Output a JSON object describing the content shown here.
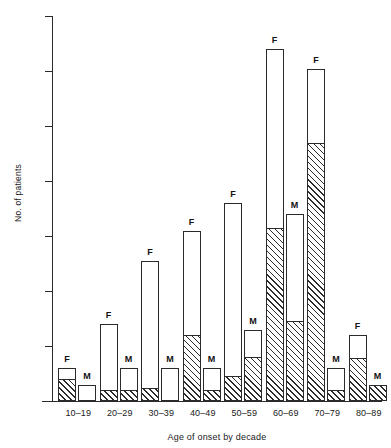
{
  "chart_data": {
    "type": "bar",
    "title": "",
    "xlabel": "Age of onset by decade",
    "ylabel": "No. of patients",
    "ylim": [
      0,
      35
    ],
    "yticks": [
      0,
      5,
      10,
      15,
      20,
      25,
      30,
      35
    ],
    "ytick_labels": [
      "",
      "5",
      "10",
      "15",
      "20",
      "25",
      "30",
      "35"
    ],
    "grid": false,
    "legend": "none",
    "categories": [
      "10–19",
      "20–29",
      "30–39",
      "40–49",
      "50–59",
      "60–69",
      "70–79",
      "80–89"
    ],
    "sex_labels": [
      "F",
      "M"
    ],
    "series": [
      {
        "name": "F (total)",
        "values": [
          3.0,
          7.0,
          12.7,
          15.5,
          18.0,
          32.0,
          30.2,
          6.0
        ]
      },
      {
        "name": "F (hatched lower segment)",
        "values": [
          2.0,
          1.0,
          1.2,
          6.0,
          2.3,
          15.7,
          23.5,
          3.9
        ]
      },
      {
        "name": "M (total)",
        "values": [
          1.5,
          3.0,
          3.0,
          3.0,
          6.5,
          17.0,
          3.0,
          1.5
        ]
      },
      {
        "name": "M (hatched lower segment)",
        "values": [
          0.0,
          1.0,
          0.0,
          1.0,
          4.0,
          7.3,
          1.0,
          1.5
        ]
      }
    ]
  },
  "axes": {
    "y_title": "No. of patients",
    "x_title": "Age of onset by decade"
  },
  "top_crop_text": ""
}
